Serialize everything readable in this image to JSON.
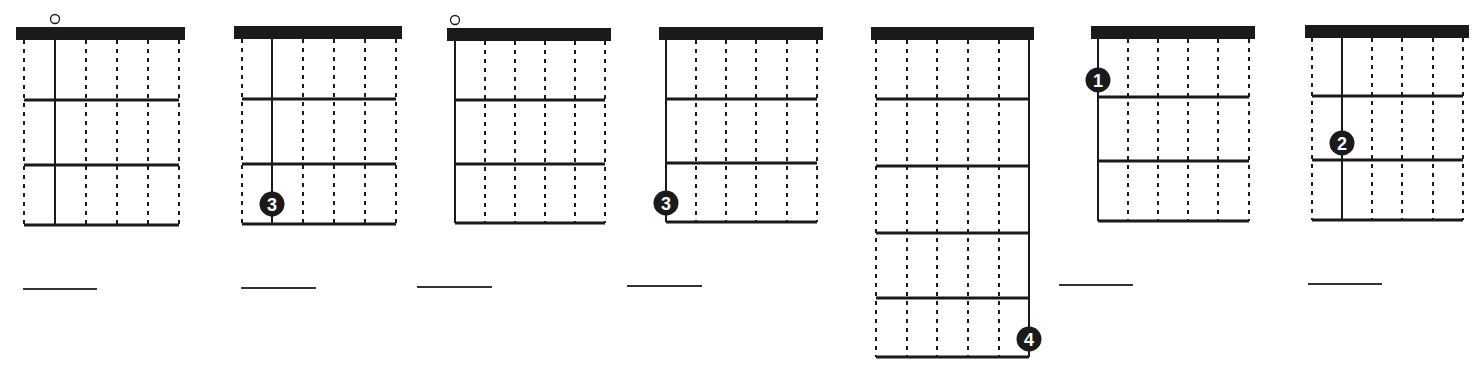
{
  "sheet": {
    "description": "Guitar fretboard single-string exercise diagrams with answer blanks",
    "colors": {
      "ink": "#1a1a1a",
      "background": "#ffffff",
      "dot_text": "#ffffff"
    },
    "string_count": 6
  },
  "diagrams": [
    {
      "id": "diagram-1",
      "nut": {
        "x": 16,
        "y": 27,
        "w": 169,
        "h": 13
      },
      "strings_x": [
        24,
        55,
        86,
        117,
        148,
        179
      ],
      "frets_y": [
        40,
        100,
        165,
        225
      ],
      "solid_string": 1,
      "open_marker": {
        "string": 1,
        "symbol": "o"
      },
      "finger_dot": null,
      "answer_line": {
        "x1": 23,
        "x2": 97,
        "y": 289
      }
    },
    {
      "id": "diagram-2",
      "nut": {
        "x": 234,
        "y": 26,
        "w": 168,
        "h": 13
      },
      "strings_x": [
        242,
        272,
        303,
        334,
        365,
        396
      ],
      "frets_y": [
        39,
        99,
        164,
        224
      ],
      "solid_string": 1,
      "open_marker": null,
      "finger_dot": {
        "string": 1,
        "fret": 3,
        "label": "3",
        "cy": 204
      },
      "answer_line": {
        "x1": 241,
        "x2": 316,
        "y": 288
      }
    },
    {
      "id": "diagram-3",
      "nut": {
        "x": 447,
        "y": 28,
        "w": 164,
        "h": 13
      },
      "strings_x": [
        455,
        485,
        515,
        545,
        575,
        605
      ],
      "frets_y": [
        41,
        100,
        164,
        223
      ],
      "solid_string": 0,
      "open_marker": {
        "string": 0,
        "symbol": "o"
      },
      "finger_dot": null,
      "answer_line": {
        "x1": 417,
        "x2": 492,
        "y": 287
      }
    },
    {
      "id": "diagram-4",
      "nut": {
        "x": 659,
        "y": 27,
        "w": 164,
        "h": 13
      },
      "strings_x": [
        666,
        696,
        726,
        756,
        787,
        817
      ],
      "frets_y": [
        40,
        99,
        163,
        222
      ],
      "solid_string": 0,
      "open_marker": null,
      "finger_dot": {
        "string": 0,
        "fret": 3,
        "label": "3",
        "cy": 203
      },
      "answer_line": {
        "x1": 627,
        "x2": 702,
        "y": 286
      }
    },
    {
      "id": "diagram-5",
      "nut": {
        "x": 871,
        "y": 27,
        "w": 163,
        "h": 13
      },
      "strings_x": [
        876,
        907,
        937,
        968,
        999,
        1029
      ],
      "frets_y": [
        40,
        99,
        166,
        233,
        298,
        357
      ],
      "solid_string": 5,
      "open_marker": null,
      "finger_dot": {
        "string": 5,
        "fret": 5,
        "label": "4",
        "cy": 339
      },
      "answer_line": null
    },
    {
      "id": "diagram-6",
      "nut": {
        "x": 1091,
        "y": 26,
        "w": 164,
        "h": 13
      },
      "strings_x": [
        1098,
        1128,
        1158,
        1188,
        1218,
        1249
      ],
      "frets_y": [
        39,
        97,
        161,
        221
      ],
      "solid_string": 0,
      "open_marker": null,
      "finger_dot": {
        "string": 0,
        "fret": 1,
        "label": "1",
        "cy": 80
      },
      "answer_line": {
        "x1": 1059,
        "x2": 1133,
        "y": 285
      }
    },
    {
      "id": "diagram-7",
      "nut": {
        "x": 1305,
        "y": 25,
        "w": 164,
        "h": 13
      },
      "strings_x": [
        1312,
        1342,
        1372,
        1402,
        1433,
        1463
      ],
      "frets_y": [
        38,
        96,
        160,
        220
      ],
      "solid_string": 1,
      "open_marker": null,
      "finger_dot": {
        "string": 1,
        "fret": 2,
        "label": "2",
        "cy": 143
      },
      "answer_line": {
        "x1": 1308,
        "x2": 1382,
        "y": 284
      }
    }
  ]
}
